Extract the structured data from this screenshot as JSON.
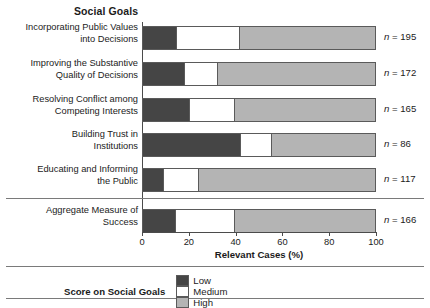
{
  "chart_data": {
    "type": "bar",
    "orientation": "horizontal",
    "stacked": true,
    "title": "Social Goals",
    "xlabel": "Relevant Cases (%)",
    "ylabel": "",
    "xlim": [
      0,
      100
    ],
    "xticks": [
      0,
      20,
      40,
      60,
      80,
      100
    ],
    "grid": false,
    "legend_position": "bottom",
    "legend_title": "Score on Social Goals",
    "series": [
      {
        "name": "Low",
        "color": "#454545",
        "values": [
          14.5,
          18.0,
          20.0,
          42.0,
          8.5,
          13.7
        ]
      },
      {
        "name": "Medium",
        "color": "#ffffff",
        "values": [
          27.0,
          13.6,
          19.3,
          13.0,
          15.0,
          25.6
        ]
      },
      {
        "name": "High",
        "color": "#b4b4b4",
        "values": [
          58.5,
          68.4,
          60.7,
          45.0,
          76.5,
          60.7
        ]
      }
    ],
    "categories": [
      "Incorporating Public Values into Decisions",
      "Improving the Substantive Quality of Decisions",
      "Resolving Conflict among Competing Interests",
      "Building Trust in Institutions",
      "Educating and Informing the Public",
      "Aggregate Measure of Success"
    ],
    "annotations": [
      "n = 195",
      "n = 172",
      "n = 165",
      "n = 86",
      "n = 117",
      "n = 166"
    ]
  },
  "title": "Social Goals",
  "rows": [
    {
      "label_line1": "Incorporating Public Values",
      "label_line2": "into Decisions",
      "low": 14.5,
      "medium": 27.0,
      "high": 58.5,
      "n_prefix": "n",
      "n_value": " = 195"
    },
    {
      "label_line1": "Improving the Substantive",
      "label_line2": "Quality of Decisions",
      "low": 18.0,
      "medium": 13.6,
      "high": 68.4,
      "n_prefix": "n",
      "n_value": " = 172"
    },
    {
      "label_line1": "Resolving Conflict among",
      "label_line2": "Competing Interests",
      "low": 20.0,
      "medium": 19.3,
      "high": 60.7,
      "n_prefix": "n",
      "n_value": " = 165"
    },
    {
      "label_line1": "Building Trust in",
      "label_line2": "Institutions",
      "low": 42.0,
      "medium": 13.0,
      "high": 45.0,
      "n_prefix": "n",
      "n_value": " = 86"
    },
    {
      "label_line1": "Educating and Informing",
      "label_line2": "the Public",
      "low": 8.5,
      "medium": 15.0,
      "high": 76.5,
      "n_prefix": "n",
      "n_value": " = 117"
    },
    {
      "label_line1": "Aggregate Measure of",
      "label_line2": "Success",
      "low": 13.7,
      "medium": 25.6,
      "high": 60.7,
      "n_prefix": "n",
      "n_value": " = 166"
    }
  ],
  "axis": {
    "ticks": [
      "0",
      "20",
      "40",
      "60",
      "80",
      "100"
    ],
    "title": "Relevant Cases (%)"
  },
  "legend": {
    "heading": "Score on Social Goals",
    "items": [
      {
        "label": "Low",
        "color": "#454545"
      },
      {
        "label": "Medium",
        "color": "#ffffff"
      },
      {
        "label": "High",
        "color": "#b4b4b4"
      }
    ]
  }
}
